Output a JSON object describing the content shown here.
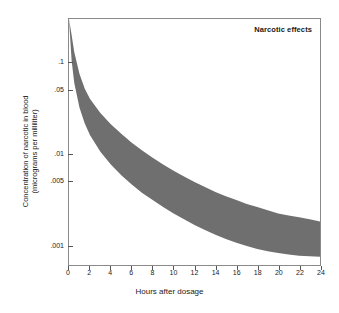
{
  "chart_data": {
    "type": "area",
    "title": "Narcotic effects",
    "xlabel": "Hours after dosage",
    "ylabel_line1": "Concentration of narcotic in blood",
    "ylabel_line2": "(micrograms per milliliter)",
    "yscale": "log",
    "xlim": [
      0,
      24
    ],
    "ylim": [
      0.0006,
      0.3
    ],
    "grid": false,
    "legend": "none",
    "xticks": [
      0,
      2,
      4,
      6,
      8,
      10,
      12,
      14,
      16,
      18,
      20,
      22,
      24
    ],
    "xtick_labels": [
      "0",
      "2",
      "4",
      "6",
      "8",
      "10",
      "12",
      "14",
      "16",
      "18",
      "20",
      "22",
      "24"
    ],
    "yticks": [
      0.001,
      0.005,
      0.01,
      0.05,
      0.1,
      0.5,
      1,
      2
    ],
    "ytick_labels": [
      ".001",
      ".005",
      ".01",
      ".05",
      ".1",
      ".5",
      "1",
      "2"
    ],
    "band_color": "#6f6f6f",
    "series": [
      {
        "name": "upper bound",
        "x": [
          0,
          0.25,
          0.5,
          1,
          1.5,
          2,
          3,
          4,
          5,
          6,
          7,
          8,
          9,
          10,
          11,
          12,
          13,
          14,
          15,
          16,
          17,
          18,
          19,
          20,
          21,
          22,
          23,
          24
        ],
        "values": [
          0.3,
          0.2,
          0.13,
          0.075,
          0.052,
          0.04,
          0.028,
          0.021,
          0.0165,
          0.0132,
          0.0108,
          0.009,
          0.0076,
          0.0065,
          0.0056,
          0.0049,
          0.0043,
          0.0038,
          0.0034,
          0.0031,
          0.0028,
          0.0026,
          0.0024,
          0.0022,
          0.0021,
          0.002,
          0.0019,
          0.0018
        ]
      },
      {
        "name": "lower bound",
        "x": [
          0,
          0.25,
          0.5,
          1,
          1.5,
          2,
          3,
          4,
          5,
          6,
          7,
          8,
          9,
          10,
          11,
          12,
          13,
          14,
          15,
          16,
          17,
          18,
          19,
          20,
          21,
          22,
          23,
          24
        ],
        "values": [
          0.3,
          0.105,
          0.06,
          0.032,
          0.0215,
          0.016,
          0.0105,
          0.0076,
          0.0058,
          0.0046,
          0.0037,
          0.0031,
          0.0026,
          0.0022,
          0.0019,
          0.00165,
          0.00145,
          0.00129,
          0.00116,
          0.00105,
          0.00097,
          0.0009,
          0.00085,
          0.00081,
          0.00078,
          0.00076,
          0.00075,
          0.00074
        ]
      }
    ]
  }
}
